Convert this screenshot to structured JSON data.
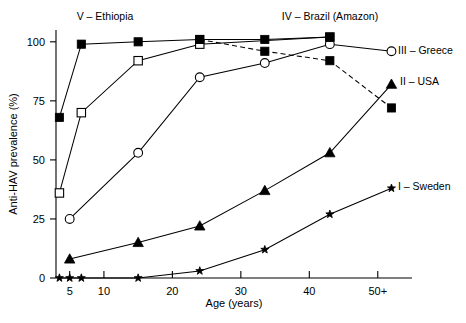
{
  "chart_data": {
    "type": "line",
    "title": "",
    "xlabel": "Age (years)",
    "ylabel": "Anti-HAV prevalence (%)",
    "xlim": [
      3,
      55
    ],
    "ylim": [
      0,
      105
    ],
    "grid": false,
    "legend_position": "inline-annotations",
    "xticks": [
      5,
      10,
      20,
      30,
      40,
      50
    ],
    "xtick_labels": [
      "5",
      "10",
      "20",
      "30",
      "40",
      "50+"
    ],
    "yticks": [
      0,
      25,
      50,
      75,
      100
    ],
    "ytick_labels": [
      "0",
      "25",
      "50",
      "75",
      "100"
    ],
    "series": [
      {
        "name": "I – Sweden",
        "label": "I – Sweden",
        "marker": "star",
        "linestyle": "solid",
        "x": [
          3.5,
          5,
          6.7,
          15,
          24,
          33.5,
          43,
          52
        ],
        "values": [
          0,
          0,
          0,
          0,
          3,
          12,
          27,
          38
        ]
      },
      {
        "name": "II – USA",
        "label": "II – USA",
        "marker": "filled-triangle",
        "linestyle": "solid",
        "x": [
          5,
          15,
          24,
          33.5,
          43,
          52
        ],
        "values": [
          8,
          15,
          22,
          37,
          53,
          82
        ]
      },
      {
        "name": "III – Greece",
        "label": "III – Greece",
        "marker": "open-circle",
        "linestyle": "solid",
        "x": [
          5,
          15,
          24,
          33.5,
          43,
          52
        ],
        "values": [
          25,
          53,
          85,
          91,
          99,
          96
        ]
      },
      {
        "name": "IV – Brazil (Amazon)",
        "label": "IV – Brazil (Amazon)",
        "marker": "open-square",
        "linestyle": "solid",
        "x": [
          3.5,
          6.7,
          15,
          24,
          43
        ],
        "values": [
          36,
          70,
          92,
          99,
          102
        ]
      },
      {
        "name": "IV – Brazil (Amazon) declining",
        "label": "",
        "marker": "filled-square",
        "linestyle": "dashed",
        "x": [
          24,
          33.5,
          43,
          52
        ],
        "values": [
          101,
          96,
          92,
          72
        ]
      },
      {
        "name": "V – Ethiopia",
        "label": "V – Ethiopia",
        "marker": "filled-square",
        "linestyle": "solid",
        "x": [
          3.5,
          6.7,
          15,
          24,
          33.5,
          43
        ],
        "values": [
          68,
          99,
          100,
          101,
          101,
          102
        ]
      }
    ],
    "annotations": [
      {
        "name": "ethiopia-label",
        "text": "V – Ethiopia",
        "x_px": 105,
        "y_px": 20,
        "anchor": "middle"
      },
      {
        "name": "brazil-label",
        "text": "IV – Brazil (Amazon)",
        "x_px": 330,
        "y_px": 20,
        "anchor": "middle"
      },
      {
        "name": "greece-label",
        "text": "III – Greece",
        "x_px": 398,
        "y_px": 54,
        "anchor": "start"
      },
      {
        "name": "usa-label",
        "text": "II – USA",
        "x_px": 400,
        "y_px": 85,
        "anchor": "start"
      },
      {
        "name": "sweden-label",
        "text": "I – Sweden",
        "x_px": 398,
        "y_px": 190,
        "anchor": "start"
      }
    ]
  }
}
